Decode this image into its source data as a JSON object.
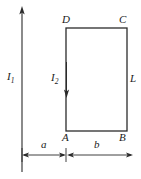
{
  "figure": {
    "background_color": "#ffffff",
    "line_color": "#2b2b2b",
    "label_color": "#1a1a1a",
    "width": 141,
    "height": 179
  },
  "labels": {
    "current_wire": "I",
    "current_wire_sub": "1",
    "current_loop": "I",
    "current_loop_sub": "2",
    "corner_a": "A",
    "corner_b": "B",
    "corner_c": "C",
    "corner_d": "D",
    "side_length": "L",
    "distance_a": "a",
    "distance_b": "b"
  },
  "geometry": {
    "wire_x": 22,
    "wire_top_y": 8,
    "wire_bottom_y": 172,
    "rect_left": 66,
    "rect_right": 127,
    "rect_top": 28,
    "rect_bottom": 131,
    "loop_arrow_x": 66,
    "loop_arrow_top_y": 62,
    "loop_arrow_bottom_y": 97,
    "dimension_line_y": 155,
    "dimension_b_right_x": 133
  }
}
